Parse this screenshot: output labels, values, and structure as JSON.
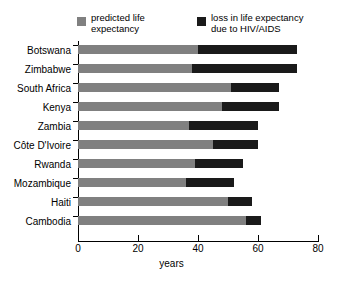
{
  "chart_data": {
    "type": "bar",
    "orientation": "horizontal",
    "stacked": true,
    "title": "",
    "xlabel": "years",
    "ylabel": "",
    "xlim": [
      0,
      80
    ],
    "xticks": [
      0,
      20,
      40,
      60,
      80
    ],
    "grid": false,
    "legend_position": "top",
    "categories": [
      "Botswana",
      "Zimbabwe",
      "South Africa",
      "Kenya",
      "Zambia",
      "Côte D'Ivoire",
      "Rwanda",
      "Mozambique",
      "Haiti",
      "Cambodia"
    ],
    "series": [
      {
        "name": "predicted life expectancy",
        "color": "#808080",
        "values": [
          40,
          38,
          51,
          48,
          37,
          45,
          39,
          36,
          50,
          56
        ]
      },
      {
        "name": "loss in life expectancy due to HIV/AIDS",
        "color": "#1a1a1a",
        "values": [
          33,
          35,
          16,
          19,
          23,
          15,
          16,
          16,
          8,
          5
        ]
      }
    ],
    "totals": [
      73,
      73,
      67,
      67,
      60,
      60,
      55,
      52,
      58,
      61
    ]
  },
  "legend": {
    "items": [
      {
        "label_line1": "predicted life",
        "label_line2": "expectancy",
        "swatch": "gray"
      },
      {
        "label_line1": "loss in life expectancy",
        "label_line2": "due to HIV/AIDS",
        "swatch": "black"
      }
    ]
  },
  "axis": {
    "xlabel": "years",
    "xticks": [
      "0",
      "20",
      "40",
      "60",
      "80"
    ]
  }
}
